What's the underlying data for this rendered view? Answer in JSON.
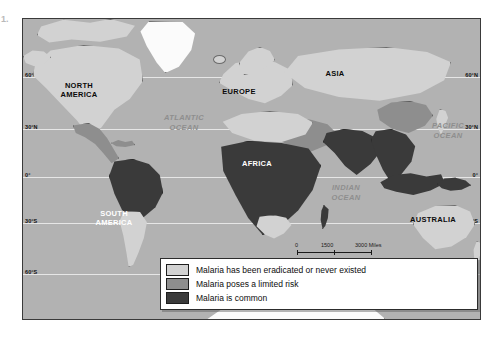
{
  "figure": {
    "number": "1."
  },
  "map": {
    "title": "World malaria distribution map",
    "latitude_labels": [
      "60°N",
      "30°N",
      "0°",
      "30°S",
      "60°S"
    ],
    "continents": [
      {
        "name": "NORTH AMERICA",
        "line1": "NORTH",
        "line2": "AMERICA",
        "style": "dark-text"
      },
      {
        "name": "SOUTH AMERICA",
        "line1": "SOUTH",
        "line2": "AMERICA",
        "style": "white-text"
      },
      {
        "name": "EUROPE",
        "line1": "EUROPE",
        "line2": "",
        "style": "dark-text"
      },
      {
        "name": "ASIA",
        "line1": "ASIA",
        "line2": "",
        "style": "dark-text"
      },
      {
        "name": "AFRICA",
        "line1": "AFRICA",
        "line2": "",
        "style": "white-text"
      },
      {
        "name": "AUSTRALIA",
        "line1": "AUSTRALIA",
        "line2": "",
        "style": "dark-text"
      }
    ],
    "oceans": [
      {
        "name": "ATLANTIC OCEAN",
        "line1": "ATLANTIC",
        "line2": "OCEAN"
      },
      {
        "name": "PACIFIC OCEAN",
        "line1": "PACIFIC",
        "line2": "OCEAN"
      },
      {
        "name": "INDIAN OCEAN",
        "line1": "INDIAN",
        "line2": "OCEAN"
      }
    ]
  },
  "scale": {
    "miles": {
      "ticks": [
        "0",
        "1500",
        "3000"
      ],
      "unit": "Miles"
    },
    "kilometers": {
      "ticks": [
        "0",
        "1500",
        "3000"
      ],
      "unit": "Kilometers"
    },
    "miles_label": "3000 Miles",
    "km_label": "3000 Kilometers"
  },
  "legend": {
    "items": [
      {
        "label": "Malaria has been eradicated or never existed",
        "color": "#d2d2d2"
      },
      {
        "label": "Malaria poses a limited risk",
        "color": "#8e8e8e"
      },
      {
        "label": "Malaria is common",
        "color": "#3a3a3a"
      }
    ]
  },
  "colors": {
    "ocean": "#b2b2b2",
    "eradicated": "#d2d2d2",
    "limited_risk": "#8e8e8e",
    "common": "#3a3a3a",
    "ice": "#fbfbfb",
    "frame": "#3a3a3a"
  }
}
